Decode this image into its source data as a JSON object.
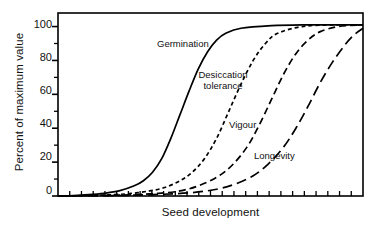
{
  "chart_data": {
    "type": "line",
    "title": "",
    "subtitle": "",
    "xlabel": "Seed development",
    "ylabel": "Percent of maximum value",
    "ylim": [
      0,
      108
    ],
    "xlim": [
      0,
      100
    ],
    "ytick_labels": [
      "0",
      "20",
      "40",
      "60",
      "80",
      "100"
    ],
    "ytick_values": [
      0,
      20,
      40,
      60,
      80,
      100
    ],
    "yminor_values": [
      10,
      30,
      50,
      70,
      90
    ],
    "xtick_labels": [],
    "xtick_count": 26,
    "grid": false,
    "legend": "inline-annotations",
    "frame": "box",
    "line_color": "#000000",
    "background": "#ffffff",
    "series": [
      {
        "name": "Germination",
        "style": "solid",
        "label": "Germination",
        "x": [
          0,
          5,
          10,
          15,
          20,
          25,
          28,
          31,
          34,
          37,
          40,
          43,
          46,
          49,
          52,
          55,
          60,
          70,
          80,
          90,
          100
        ],
        "values": [
          0,
          0.3,
          0.8,
          1.6,
          3,
          6,
          9,
          14,
          22,
          34,
          48,
          62,
          75,
          85,
          92,
          96,
          99,
          100.5,
          101,
          101,
          101
        ]
      },
      {
        "name": "Desiccation tolerance",
        "style": "dashed-short",
        "label": "Desiccation tolerance",
        "x": [
          0,
          10,
          18,
          24,
          30,
          35,
          40,
          44,
          48,
          52,
          56,
          60,
          64,
          68,
          72,
          80,
          90,
          100
        ],
        "values": [
          0,
          0.3,
          0.8,
          1.5,
          3,
          5,
          9,
          14,
          22,
          34,
          50,
          66,
          80,
          90,
          96,
          100,
          101,
          101
        ]
      },
      {
        "name": "Vigour",
        "style": "dashed-medium",
        "label": "Vigour",
        "x": [
          0,
          15,
          25,
          33,
          40,
          46,
          52,
          57,
          62,
          66,
          70,
          74,
          78,
          82,
          86,
          92,
          100
        ],
        "values": [
          0,
          0.3,
          0.8,
          1.6,
          3,
          6,
          11,
          18,
          29,
          42,
          57,
          72,
          84,
          92,
          97,
          100,
          101
        ]
      },
      {
        "name": "Longevity",
        "style": "dashed-long",
        "label": "Longevity",
        "x": [
          0,
          20,
          34,
          44,
          52,
          58,
          64,
          69,
          74,
          78,
          82,
          86,
          90,
          94,
          97,
          100
        ],
        "values": [
          0,
          0.3,
          1,
          2,
          4,
          7,
          12,
          19,
          29,
          40,
          53,
          67,
          79,
          89,
          95,
          99
        ]
      }
    ],
    "annotations": [
      {
        "text": "Germination",
        "x": 157,
        "y": 40
      },
      {
        "text": "Desiccation tolerance",
        "x": 193,
        "y": 70
      },
      {
        "text": "Vigour",
        "x": 229,
        "y": 121
      },
      {
        "text": "Longevity",
        "x": 254,
        "y": 152
      }
    ]
  }
}
